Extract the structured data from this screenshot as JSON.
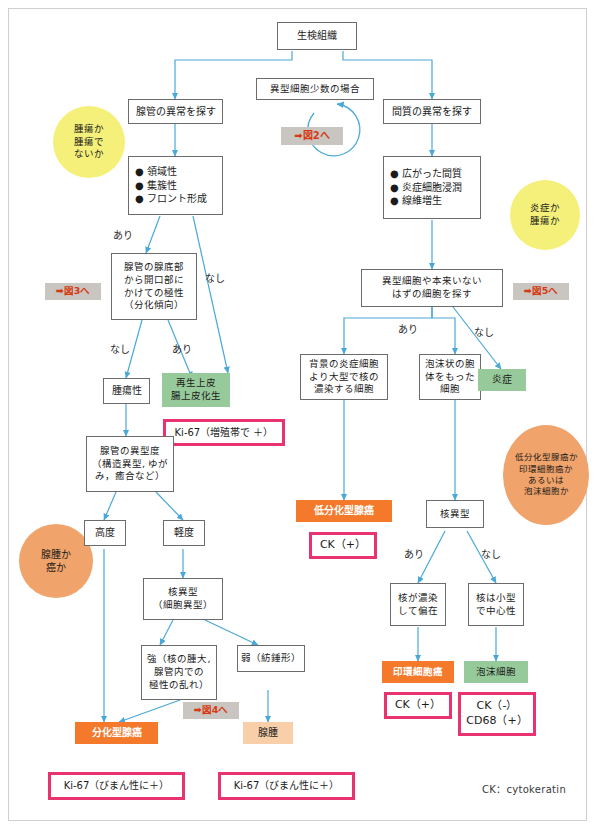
{
  "diagram": {
    "title_node": "生検組織",
    "legend": "CK：cytokeratin",
    "nodes": {
      "biopsy": "生検組織",
      "gland_search": "腺管の異常を探す",
      "gland_features": "● 領域性\n● 集簇性\n● フロント形成",
      "few_atypical": "異型細胞少数の場合",
      "to_fig2": "➡図2へ",
      "stroma_search": "間質の異常を探す",
      "stroma_features": "● 広がった間質\n● 炎症細胞浸潤\n● 線維増生",
      "polarity": "腺管の腺底部\nから開口部に\nかけての極性\n（分化傾向）",
      "to_fig3": "➡図3へ",
      "neoplastic": "腫瘍性",
      "regenerative": "再生上皮\n腸上皮化生",
      "ki67_prolif": "Ki-67（増殖帯で ＋）",
      "gland_atypia": "腺管の異型度\n（構造異型, ゆが\nみ，癒合など）",
      "high_grade": "高度",
      "low_grade": "軽度",
      "nuclear_atypia_left": "核異型\n（細胞異型）",
      "strong": "強（核の腫大,\n腺管内での\n極性の乱れ）",
      "weak": "弱（紡錘形）",
      "to_fig4": "➡図4へ",
      "diff_adeno": "分化型腺癌",
      "adenoma": "腺腫",
      "ki67_diffuse_left": "Ki-67（びまん性に＋）",
      "ki67_diffuse_right": "Ki-67（びまん性に＋）",
      "atypical_search": "異型細胞や本来いない\nはずの細胞を探す",
      "to_fig5": "➡図5へ",
      "large_dark": "背景の炎症細胞\nより大型で核の\n濃染する細胞",
      "foamy_cyto": "泡沫状の胞\n体をもった\n細胞",
      "inflammation": "炎症",
      "poorly_diff": "低分化型腺癌",
      "ck_pos_poorly": "CK（+）",
      "nuclear_atypia_right": "核異型",
      "dark_eccentric": "核が濃染\nして偏在",
      "small_central": "核は小型\nで中心性",
      "signet_ring": "印環細胞癌",
      "foamy_cell": "泡沫細胞",
      "ck_pos_signet": "CK（+）",
      "ck_neg_cd68": "CK（-）\nCD68（+）"
    },
    "circles": {
      "tumor_or_not": "腫瘍か\n腫瘍で\nないか",
      "inflammation_or_tumor": "炎症か\n腫瘍か",
      "adenoma_or_cancer": "腺腫か\n癌か",
      "poorly_or_signet": "低分化型腺癌か\n印環細胞癌か\nあるいは\n泡沫細胞か"
    },
    "edge_labels": {
      "ari_1": "あり",
      "nashi_1": "なし",
      "nashi_2": "なし",
      "ari_2": "あり",
      "ari_3": "あり",
      "nashi_3": "なし",
      "ari_4": "あり",
      "nashi_4": "なし"
    },
    "colors": {
      "edge": "#4aa8d8",
      "green": "#97ca9a",
      "orange": "#f4792a",
      "light_orange": "#f8cfa8",
      "yellow_circle": "#f5f07a",
      "orange_circle": "#f0a36a",
      "pink_border": "#e8336e",
      "gray_box": "#c9c5c0",
      "arrow_red": "#e23c10",
      "box_border": "#6b6b6b"
    }
  }
}
